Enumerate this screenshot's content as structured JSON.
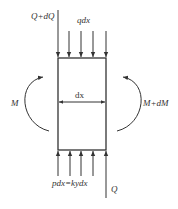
{
  "diagram": {
    "type": "beam-element-free-body",
    "labels": {
      "shear_top": "Q+dQ",
      "distributed_load": "qdx",
      "width": "dx",
      "moment_left": "M",
      "moment_right": "M+dM",
      "reaction": "pdx=kydx",
      "shear_bottom": "Q"
    },
    "colors": {
      "stroke": "#333333",
      "background": "#ffffff"
    },
    "top_arrows_x": [
      58,
      69,
      81,
      93,
      106
    ],
    "bottom_arrows_x": [
      58,
      70,
      81,
      93,
      106
    ]
  }
}
